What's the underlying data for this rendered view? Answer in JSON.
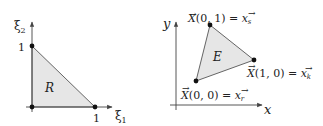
{
  "left_diagram": {
    "name": "reference-element",
    "axis_x_label": "ξ",
    "axis_x_sub": "1",
    "axis_y_label": "ξ",
    "axis_y_sub": "2",
    "tick_y": "1",
    "tick_x": "1",
    "region_label": "R",
    "fill_color": "#e6e6e6",
    "stroke_color": "#555555"
  },
  "right_diagram": {
    "name": "physical-element",
    "axis_x_label": "x",
    "axis_y_label": "y",
    "region_label": "E",
    "vertex_top": {
      "map": "X",
      "args": "(0, 1)",
      "eq": " = ",
      "vec": "x",
      "sub": "s"
    },
    "vertex_right": {
      "map": "X",
      "args": "(1, 0)",
      "eq": " = ",
      "vec": "x",
      "sub": "k"
    },
    "vertex_bottom": {
      "map": "X",
      "args": "(0, 0)",
      "eq": " = ",
      "vec": "x",
      "sub": "r"
    },
    "fill_color": "#e6e6e6",
    "stroke_color": "#555555"
  }
}
